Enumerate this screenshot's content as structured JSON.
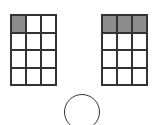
{
  "diagram": {
    "grids": [
      {
        "name": "left-grid",
        "rows": 4,
        "cols": 3,
        "x": 10,
        "y": 14,
        "width": 47,
        "height": 72,
        "shaded_cells": [
          [
            0,
            0
          ]
        ]
      },
      {
        "name": "right-grid",
        "rows": 4,
        "cols": 3,
        "x": 101,
        "y": 14,
        "width": 47,
        "height": 72,
        "shaded_cells": [
          [
            0,
            0
          ],
          [
            0,
            1
          ],
          [
            0,
            2
          ]
        ]
      }
    ],
    "circle": {
      "shape": "circle",
      "partially_visible": true
    },
    "colors": {
      "shaded": "#8c8c8c",
      "line": "#333333",
      "background": "#ffffff"
    }
  }
}
